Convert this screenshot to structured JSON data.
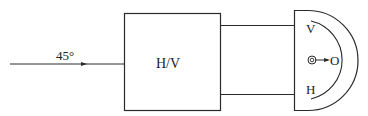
{
  "diagram": {
    "input_beam": {
      "label": "45°"
    },
    "main_block": {
      "label": "H/V"
    },
    "detector_head": {
      "top_label": "V",
      "bottom_label": "H",
      "output_label": "O"
    }
  },
  "colors": {
    "stroke": "#2a2a2a",
    "background": "#ffffff"
  }
}
